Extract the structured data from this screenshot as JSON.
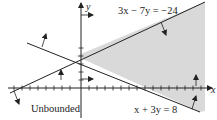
{
  "diagram": {
    "axes": {
      "x_label": "x",
      "y_label": "y"
    },
    "lines": [
      {
        "id": "line-a",
        "equation": "3x − 7y = −24"
      },
      {
        "id": "line-b",
        "equation": "x + 3y = 8"
      }
    ],
    "region": {
      "label": "Unbounded",
      "fill_color": "#d9d9d9"
    },
    "colors": {
      "stroke": "#222222",
      "shade": "#d9d9d9",
      "background": "#ffffff"
    }
  }
}
